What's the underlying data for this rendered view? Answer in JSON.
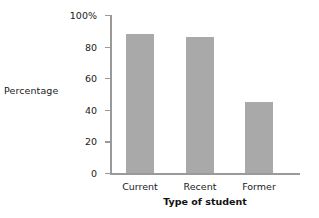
{
  "chart_data": {
    "type": "bar",
    "title": "",
    "subtitle": "",
    "xlabel": "Type of student",
    "ylabel": "Percentage",
    "categories": [
      "Current",
      "Recent",
      "Former"
    ],
    "values": [
      88,
      86,
      45
    ],
    "series": [
      {
        "name": "Percentage",
        "values": [
          88,
          86,
          45
        ]
      }
    ],
    "ylim": [
      0,
      100
    ],
    "yticks": [
      0,
      20,
      40,
      60,
      80,
      100
    ],
    "ytick_labels": [
      "0",
      "20",
      "40",
      "60",
      "80",
      "100%"
    ],
    "grid": false,
    "legend": false,
    "legend_position": "none",
    "bar_color": "#a9a9a9",
    "axis_color": "#9a9a9a",
    "text_color": "#1a1a1a"
  }
}
